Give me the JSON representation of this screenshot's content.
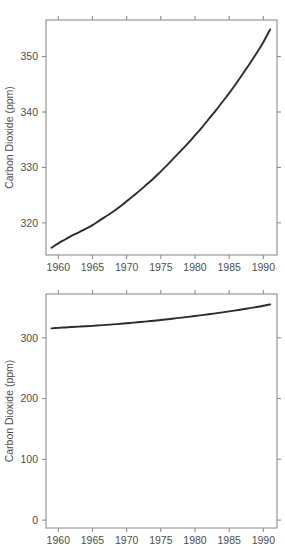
{
  "figure": {
    "background_color": "#ffffff",
    "frame_color": "#8c8c8c",
    "line_color": "#2b2b2b",
    "text_color": "#4d4d4d"
  },
  "chart_data": [
    {
      "type": "line",
      "panel": "top",
      "title": "",
      "xlabel": "",
      "ylabel": "Carbon Dioxide (ppm)",
      "xlim": [
        1958.2,
        1992.0
      ],
      "ylim": [
        314.2,
        356.6
      ],
      "grid": false,
      "legend": "none",
      "xticks": [
        1960,
        1965,
        1970,
        1975,
        1980,
        1985,
        1990
      ],
      "xticklabels": [
        "1960",
        "1965",
        "1970",
        "1975",
        "1980",
        "1985",
        "1990"
      ],
      "yticks": [
        320,
        330,
        340,
        350
      ],
      "yticklabels": [
        "320",
        "330",
        "340",
        "350"
      ],
      "x": [
        1959,
        1960,
        1961,
        1962,
        1963,
        1964,
        1965,
        1966,
        1967,
        1968,
        1969,
        1970,
        1971,
        1972,
        1973,
        1974,
        1975,
        1976,
        1977,
        1978,
        1979,
        1980,
        1981,
        1982,
        1983,
        1984,
        1985,
        1986,
        1987,
        1988,
        1989,
        1990,
        1991
      ],
      "y": [
        315.5,
        316.3,
        317.0,
        317.7,
        318.3,
        318.9,
        319.6,
        320.4,
        321.2,
        322.0,
        322.9,
        323.9,
        324.9,
        325.9,
        327.0,
        328.1,
        329.3,
        330.5,
        331.8,
        333.1,
        334.4,
        335.8,
        337.2,
        338.7,
        340.2,
        341.8,
        343.4,
        345.1,
        346.9,
        348.7,
        350.6,
        352.6,
        354.9
      ],
      "series_name": "Atmospheric CO2 concentration"
    },
    {
      "type": "line",
      "panel": "bottom",
      "title": "",
      "xlabel": "",
      "ylabel": "Carbon Dioxide (ppm)",
      "xlim": [
        1958.2,
        1992.0
      ],
      "ylim": [
        -13.0,
        372.0
      ],
      "grid": false,
      "legend": "none",
      "xticks": [
        1960,
        1965,
        1970,
        1975,
        1980,
        1985,
        1990
      ],
      "xticklabels": [
        "1960",
        "1965",
        "1970",
        "1975",
        "1980",
        "1985",
        "1990"
      ],
      "yticks": [
        0,
        100,
        200,
        300
      ],
      "yticklabels": [
        "0",
        "100",
        "200",
        "300"
      ],
      "x": [
        1959,
        1960,
        1961,
        1962,
        1963,
        1964,
        1965,
        1966,
        1967,
        1968,
        1969,
        1970,
        1971,
        1972,
        1973,
        1974,
        1975,
        1976,
        1977,
        1978,
        1979,
        1980,
        1981,
        1982,
        1983,
        1984,
        1985,
        1986,
        1987,
        1988,
        1989,
        1990,
        1991
      ],
      "y": [
        315.5,
        316.3,
        317.0,
        317.7,
        318.3,
        318.9,
        319.6,
        320.4,
        321.2,
        322.0,
        322.9,
        323.9,
        324.9,
        325.9,
        327.0,
        328.1,
        329.3,
        330.5,
        331.8,
        333.1,
        334.4,
        335.8,
        337.2,
        338.7,
        340.2,
        341.8,
        343.4,
        345.1,
        346.9,
        348.7,
        350.6,
        352.6,
        354.9
      ],
      "series_name": "Atmospheric CO2 concentration"
    }
  ]
}
